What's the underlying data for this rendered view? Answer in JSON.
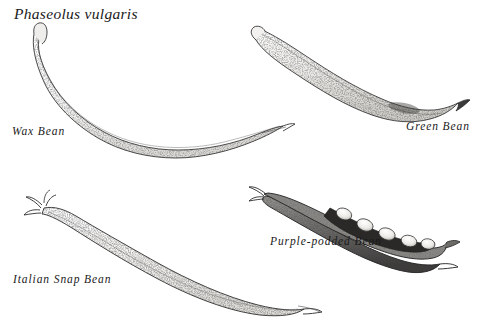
{
  "plate": {
    "species_title": "Phaseolus vulgaris",
    "background_color": "#ffffff",
    "ink_color": "#1a1a1a",
    "medium": "pen-and-ink stipple botanical illustration",
    "specimen_count": 4
  },
  "specimens": [
    {
      "label": "Wax Bean",
      "position": "upper-left",
      "description": "long slender curved pod, lightly stippled, hooked stem at top-left, tapering pointed tip at right"
    },
    {
      "label": "Green Bean",
      "position": "upper-right",
      "description": "slender sinuous pod angled down-right, stippled shading, curled tip at lower right"
    },
    {
      "label": "Italian Snap Bean",
      "position": "lower-left",
      "description": "broad flat romano pod, heavy stipple, branching calyx at upper-left, pointed beak tip at lower right"
    },
    {
      "label": "Purple-podded Bean",
      "position": "lower-right",
      "description": "dark split pod opened lengthwise revealing five pale oval seeds",
      "seed_count": 5
    }
  ]
}
